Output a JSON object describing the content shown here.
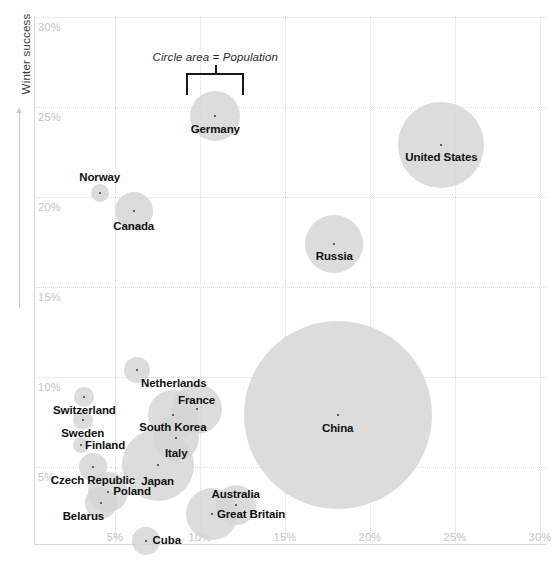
{
  "chart_data": {
    "type": "scatter",
    "title": "",
    "subtitle": "",
    "xlabel": "",
    "ylabel": "Winter success",
    "xlim": [
      2.0,
      31.8
    ],
    "ylim": [
      1.2,
      31.5
    ],
    "xticks": [
      "5%",
      "10%",
      "15%",
      "20%",
      "25%",
      "30%"
    ],
    "yticks": [
      "5%",
      "10%",
      "15%",
      "20%",
      "25%",
      "30%"
    ],
    "xtick_values": [
      5,
      10,
      15,
      20,
      25,
      30
    ],
    "ytick_values": [
      5,
      10,
      15,
      20,
      25,
      30
    ],
    "grid": true,
    "legend_position": "none",
    "size_encoding": "Circle area = Population",
    "annotation": {
      "text": "Circle area = Population",
      "points_to": "Germany"
    },
    "points": [
      {
        "label": "Germany",
        "x": 10.9,
        "y": 24.5,
        "r": 25,
        "label_dx": 0,
        "label_dy": 7,
        "label_align": "center"
      },
      {
        "label": "United States",
        "x": 24.2,
        "y": 22.9,
        "r": 43,
        "label_dx": 0,
        "label_dy": 6,
        "label_align": "center"
      },
      {
        "label": "Norway",
        "x": 4.1,
        "y": 20.2,
        "r": 9,
        "label_dx": 0,
        "label_dy": -22,
        "label_align": "center"
      },
      {
        "label": "Canada",
        "x": 6.1,
        "y": 19.2,
        "r": 19,
        "label_dx": 0,
        "label_dy": 9,
        "label_align": "center"
      },
      {
        "label": "Russia",
        "x": 17.9,
        "y": 17.4,
        "r": 29,
        "label_dx": 0,
        "label_dy": 6,
        "label_align": "center"
      },
      {
        "label": "China",
        "x": 18.1,
        "y": 7.9,
        "r": 94,
        "label_dx": 0,
        "label_dy": 7,
        "label_align": "center"
      },
      {
        "label": "Netherlands",
        "x": 6.3,
        "y": 10.4,
        "r": 13,
        "label_dx": 4,
        "label_dy": 7,
        "label_align": "left"
      },
      {
        "label": "Switzerland",
        "x": 3.2,
        "y": 8.9,
        "r": 10,
        "label_dx": 0,
        "label_dy": 7,
        "label_align": "center"
      },
      {
        "label": "Sweden",
        "x": 3.1,
        "y": 7.6,
        "r": 10,
        "label_dx": 0,
        "label_dy": 7,
        "label_align": "center"
      },
      {
        "label": "Finland",
        "x": 3.0,
        "y": 6.2,
        "r": 8,
        "label_dx": 4,
        "label_dy": -6,
        "label_align": "left"
      },
      {
        "label": "France",
        "x": 9.8,
        "y": 8.2,
        "r": 25,
        "label_dx": 0,
        "label_dy": -15,
        "label_align": "center"
      },
      {
        "label": "South Korea",
        "x": 8.4,
        "y": 7.9,
        "r": 25,
        "label_dx": 0,
        "label_dy": 6,
        "label_align": "center"
      },
      {
        "label": "Italy",
        "x": 8.6,
        "y": 6.6,
        "r": 23,
        "label_dx": 0,
        "label_dy": 9,
        "label_align": "center"
      },
      {
        "label": "Japan",
        "x": 7.5,
        "y": 5.1,
        "r": 36,
        "label_dx": 0,
        "label_dy": 10,
        "label_align": "center"
      },
      {
        "label": "Czech Republic",
        "x": 3.7,
        "y": 5.0,
        "r": 14,
        "label_dx": 0,
        "label_dy": 7,
        "label_align": "center"
      },
      {
        "label": "Poland",
        "x": 4.6,
        "y": 3.6,
        "r": 20,
        "label_dx": 5,
        "label_dy": -7,
        "label_align": "left"
      },
      {
        "label": "Belarus",
        "x": 4.2,
        "y": 3.0,
        "r": 16,
        "label_dx": -18,
        "label_dy": 7,
        "label_align": "center"
      },
      {
        "label": "Australia",
        "x": 12.1,
        "y": 2.9,
        "r": 20,
        "label_dx": 0,
        "label_dy": -17,
        "label_align": "center"
      },
      {
        "label": "Great Britain",
        "x": 10.7,
        "y": 2.4,
        "r": 26,
        "label_dx": 5,
        "label_dy": -6,
        "label_align": "left"
      },
      {
        "label": "Cuba",
        "x": 6.8,
        "y": 0.9,
        "r": 14,
        "label_dx": 7,
        "label_dy": -7,
        "label_align": "left"
      }
    ]
  },
  "axis": {
    "y_title": "Winter success"
  },
  "colors": {
    "bubble_fill": "#d4d4d4",
    "grid": "#dcdcdc",
    "tick_text": "#c4c4c4",
    "label_text": "#111111",
    "frame": "#d8d8d8"
  }
}
